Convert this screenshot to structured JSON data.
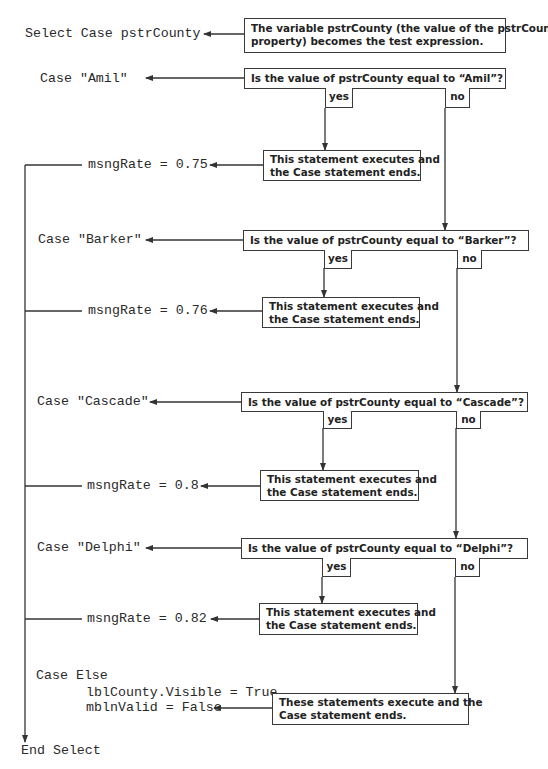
{
  "code": {
    "select_line": "Select Case pstrCounty",
    "cases": [
      {
        "case_line": "Case \"Amil\"",
        "statement": "msngRate = 0.75"
      },
      {
        "case_line": "Case \"Barker\"",
        "statement": "msngRate = 0.76"
      },
      {
        "case_line": "Case \"Cascade\"",
        "statement": "msngRate = 0.8"
      },
      {
        "case_line": "Case \"Delphi\"",
        "statement": "msngRate = 0.82"
      }
    ],
    "else_line": "Case Else",
    "else_statements": [
      "lblCounty.Visible = True",
      "mblnValid = False"
    ],
    "end_line": "End Select"
  },
  "callouts": {
    "test_expression": [
      "The variable pstrCounty (the value of the pstrCounty",
      "property) becomes the test expression."
    ],
    "questions": [
      "Is the value of pstrCounty equal to “Amil”?",
      "Is the value of pstrCounty equal to “Barker”?",
      "Is the value of pstrCounty equal to “Cascade”?",
      "Is the value of pstrCounty equal to “Delphi”?"
    ],
    "executes": [
      "This statement executes and",
      "the Case statement ends."
    ],
    "else_executes": [
      "These statements execute and the",
      "Case statement ends."
    ],
    "yes_label": "yes",
    "no_label": "no"
  },
  "colors": {
    "line": "#333333",
    "text": "#2a2a2a",
    "background": "#ffffff"
  }
}
